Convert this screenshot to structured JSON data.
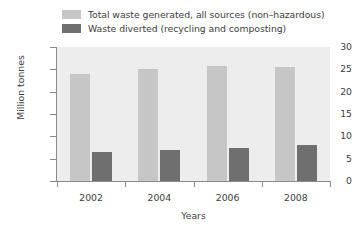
{
  "chart_data": {
    "type": "bar",
    "title": "",
    "xlabel": "Years",
    "ylabel": "Million tonnes",
    "categories": [
      "2002",
      "2004",
      "2006",
      "2008"
    ],
    "ylim": [
      0,
      30
    ],
    "yticks": [
      0,
      5,
      10,
      15,
      20,
      25,
      30
    ],
    "ytick_labels": [
      "0",
      "5",
      "10",
      "15",
      "20",
      "25",
      "30"
    ],
    "grid": false,
    "legend_position": "top-left",
    "series": [
      {
        "name": "Total waste generated, all sources (non–hazardous)",
        "color": "#c6c6c6",
        "values": [
          24.0,
          25.0,
          25.7,
          25.6
        ]
      },
      {
        "name": "Waste diverted (recycling and composting)",
        "color": "#6f6f6f",
        "values": [
          6.5,
          7.0,
          7.4,
          8.0
        ]
      }
    ]
  },
  "legend": {
    "items": [
      {
        "label": "Total waste generated, all sources (non–hazardous)",
        "color": "#c6c6c6"
      },
      {
        "label": "Waste diverted (recycling and composting)",
        "color": "#6f6f6f"
      }
    ]
  },
  "colors": {
    "plot_background": "#ededed",
    "page_background": "#ffffff",
    "axis": "#8a8a8a",
    "text": "#3d3d3d",
    "series_light": "#c6c6c6",
    "series_dark": "#6f6f6f"
  }
}
